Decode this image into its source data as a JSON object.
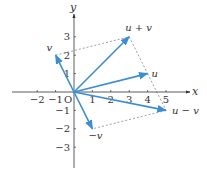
{
  "diagram": {
    "colors": {
      "vector": "#3c8ed4",
      "axis": "#333333",
      "dashed": "#888888",
      "text": "#333333"
    },
    "axes": {
      "x_label": "x",
      "y_label": "y",
      "origin_label": "O",
      "x_ticks": [
        {
          "value": -2,
          "label": "−2"
        },
        {
          "value": -1,
          "label": "−1"
        },
        {
          "value": 1,
          "label": "1"
        },
        {
          "value": 2,
          "label": "2"
        },
        {
          "value": 3,
          "label": "3"
        },
        {
          "value": 4,
          "label": "4"
        },
        {
          "value": 5,
          "label": "5"
        }
      ],
      "y_ticks": [
        {
          "value": 3,
          "label": "3"
        },
        {
          "value": 2,
          "label": "2"
        },
        {
          "value": 1,
          "label": "1"
        },
        {
          "value": -1,
          "label": "−1"
        },
        {
          "value": -2,
          "label": "−2"
        },
        {
          "value": -3,
          "label": "−3"
        }
      ]
    },
    "vectors": [
      {
        "name": "u",
        "label": "u",
        "x": 4,
        "y": 1
      },
      {
        "name": "v",
        "label": "v",
        "x": -1,
        "y": 2
      },
      {
        "name": "u_plus_v",
        "label": "u + v",
        "x": 3,
        "y": 3
      },
      {
        "name": "u_minus_v",
        "label": "u − v",
        "x": 5,
        "y": -1
      },
      {
        "name": "neg_v",
        "label": "−v",
        "x": 1,
        "y": -2
      }
    ],
    "dashed_segments": [
      {
        "from": [
          -1,
          2
        ],
        "to": [
          3,
          3
        ]
      },
      {
        "from": [
          3,
          3
        ],
        "to": [
          4,
          1
        ]
      },
      {
        "from": [
          4,
          1
        ],
        "to": [
          5,
          -1
        ]
      },
      {
        "from": [
          5,
          -1
        ],
        "to": [
          1,
          -2
        ]
      }
    ]
  }
}
